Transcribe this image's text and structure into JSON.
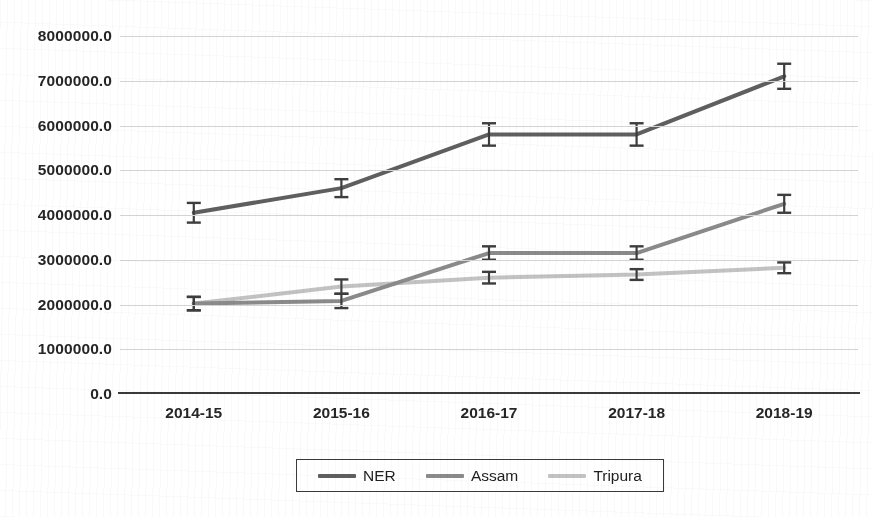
{
  "chart_data": {
    "type": "line",
    "title": "",
    "xlabel": "",
    "ylabel": "",
    "categories": [
      "2014-15",
      "2015-16",
      "2016-17",
      "2017-18",
      "2018-19"
    ],
    "ylim": [
      0,
      8000000
    ],
    "ytick_labels": [
      "8000000.0",
      "7000000.0",
      "6000000.0",
      "5000000.0",
      "4000000.0",
      "3000000.0",
      "2000000.0",
      "1000000.0",
      "0.0"
    ],
    "ytick_values": [
      8000000,
      7000000,
      6000000,
      5000000,
      4000000,
      3000000,
      2000000,
      1000000,
      0
    ],
    "grid": true,
    "legend_position": "bottom",
    "error_bars": true,
    "series": [
      {
        "name": "NER",
        "color": "#5f5f5f",
        "values": [
          4050000,
          4600000,
          5800000,
          5800000,
          7100000
        ],
        "errors": [
          220000,
          200000,
          250000,
          250000,
          280000
        ]
      },
      {
        "name": "Assam",
        "color": "#8a8a8a",
        "values": [
          2020000,
          2080000,
          3150000,
          3150000,
          4250000
        ],
        "errors": [
          150000,
          160000,
          150000,
          150000,
          200000
        ]
      },
      {
        "name": "Tripura",
        "color": "#c2c2c2",
        "values": [
          2020000,
          2400000,
          2600000,
          2670000,
          2820000
        ],
        "errors": [
          150000,
          160000,
          130000,
          120000,
          120000
        ]
      }
    ]
  },
  "legend": {
    "items": [
      {
        "label": "NER"
      },
      {
        "label": "Assam"
      },
      {
        "label": "Tripura"
      }
    ]
  }
}
